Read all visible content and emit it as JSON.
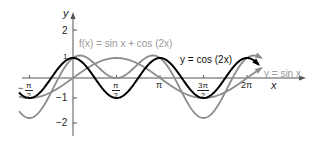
{
  "chart_data": {
    "type": "line",
    "title": "",
    "xlabel": "x",
    "ylabel": "y",
    "xlim": [
      -2.0,
      7.0
    ],
    "ylim": [
      -2.4,
      2.2
    ],
    "grid": false,
    "x_ticks": [
      {
        "value": -1.5708,
        "label": "-π/2"
      },
      {
        "value": 1.5708,
        "label": "π/2"
      },
      {
        "value": 3.1416,
        "label": "π"
      },
      {
        "value": 4.7124,
        "label": "3π/2"
      },
      {
        "value": 6.2832,
        "label": "2π"
      }
    ],
    "y_ticks": [
      {
        "value": 2,
        "label": "2"
      },
      {
        "value": 1,
        "label": "1"
      },
      {
        "value": -1,
        "label": "-1"
      },
      {
        "value": -2,
        "label": "-2"
      }
    ],
    "series": [
      {
        "name": "f(x) = sin x + cos (2x)",
        "expr": "sin(x)+cos(2x)",
        "color": "#8c8c8c",
        "x_range": [
          -1.95,
          6.8
        ]
      },
      {
        "name": "y = cos (2x)",
        "expr": "cos(2x)",
        "color": "#000000",
        "x_range": [
          -1.95,
          6.7
        ]
      },
      {
        "name": "y = sin x",
        "expr": "sin(x)",
        "color": "#8c8c8c",
        "x_range": [
          -1.95,
          6.8
        ]
      }
    ],
    "annotations": [
      {
        "text": "f(x) = sin x + cos (2x)",
        "color": "#9a9a9a"
      },
      {
        "text": "y = cos (2x)",
        "color": "#000000"
      },
      {
        "text": "y = sin x",
        "color": "#9a9a9a"
      }
    ]
  },
  "labels": {
    "y_axis": "y",
    "x_axis": "x",
    "f_label": "f(x) = sin x + cos (2x)",
    "cos_label": "y = cos (2x)",
    "sin_label": "y = sin x",
    "tick_2": "2",
    "tick_1": "1",
    "tick_m1": "−1",
    "tick_m2": "−2",
    "pi": "π",
    "two_pi": "2π",
    "neg_sign": "−",
    "pi_num": "π",
    "two_den": "2",
    "three_pi_num": "3π"
  }
}
